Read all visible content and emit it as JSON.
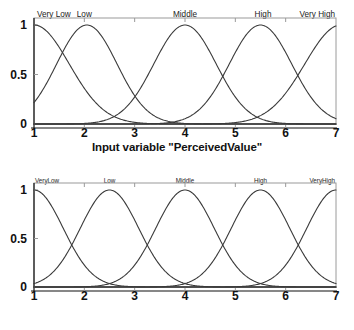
{
  "figure": {
    "panels": [
      {
        "id": "perceived-value",
        "axis_title": "Input variable \"PerceivedValue\"",
        "label_style": "spaced",
        "yticks": [
          "1",
          "0.5",
          "0"
        ],
        "xticks": [
          "1",
          "2",
          "3",
          "4",
          "5",
          "6",
          "7"
        ],
        "terms": [
          "Very Low",
          "Low",
          "Middle",
          "High",
          "Very High"
        ]
      },
      {
        "id": "interactivity",
        "axis_title": "Input variable \"Interactivity\"",
        "label_style": "compact",
        "yticks": [
          "1",
          "0.5",
          "0"
        ],
        "xticks": [
          "1",
          "2",
          "3",
          "4",
          "5",
          "6",
          "7"
        ],
        "terms": [
          "VeryLow",
          "Low",
          "Middle",
          "High",
          "VeryHigh"
        ]
      }
    ]
  },
  "chart_data": [
    {
      "type": "line",
      "title": "",
      "xlabel": "Input variable \"PerceivedValue\"",
      "ylabel": "",
      "xlim": [
        1,
        7
      ],
      "ylim": [
        0,
        1
      ],
      "xticks": [
        1,
        2,
        3,
        4,
        5,
        6,
        7
      ],
      "yticks": [
        0,
        0.5,
        1
      ],
      "grid": false,
      "legend": "none",
      "annotations": [
        "Very Low",
        "Low",
        "Middle",
        "High",
        "Very High"
      ],
      "series": [
        {
          "name": "Very Low",
          "shape": "gaussian",
          "center": 1.0,
          "sigma": 0.7,
          "peak": 1.0
        },
        {
          "name": "Low",
          "shape": "gaussian",
          "center": 2.05,
          "sigma": 0.6,
          "peak": 1.0
        },
        {
          "name": "Middle",
          "shape": "gaussian",
          "center": 4.0,
          "sigma": 0.62,
          "peak": 1.0
        },
        {
          "name": "High",
          "shape": "gaussian",
          "center": 5.5,
          "sigma": 0.62,
          "peak": 1.0
        },
        {
          "name": "Very High",
          "shape": "gaussian",
          "center": 7.1,
          "sigma": 0.72,
          "peak": 1.0
        }
      ]
    },
    {
      "type": "line",
      "title": "",
      "xlabel": "Input variable \"Interactivity\"",
      "ylabel": "",
      "xlim": [
        1,
        7
      ],
      "ylim": [
        0,
        1
      ],
      "xticks": [
        1,
        2,
        3,
        4,
        5,
        6,
        7
      ],
      "yticks": [
        0,
        0.5,
        1
      ],
      "grid": false,
      "legend": "none",
      "annotations": [
        "VeryLow",
        "Low",
        "Middle",
        "High",
        "VeryHigh"
      ],
      "series": [
        {
          "name": "VeryLow",
          "shape": "gaussian",
          "center": 1.0,
          "sigma": 0.58,
          "peak": 1.0
        },
        {
          "name": "Low",
          "shape": "gaussian",
          "center": 2.5,
          "sigma": 0.58,
          "peak": 1.0
        },
        {
          "name": "Middle",
          "shape": "gaussian",
          "center": 4.0,
          "sigma": 0.58,
          "peak": 1.0
        },
        {
          "name": "High",
          "shape": "gaussian",
          "center": 5.5,
          "sigma": 0.58,
          "peak": 1.0
        },
        {
          "name": "VeryHigh",
          "shape": "gaussian",
          "center": 7.0,
          "sigma": 0.58,
          "peak": 1.0
        }
      ]
    }
  ]
}
